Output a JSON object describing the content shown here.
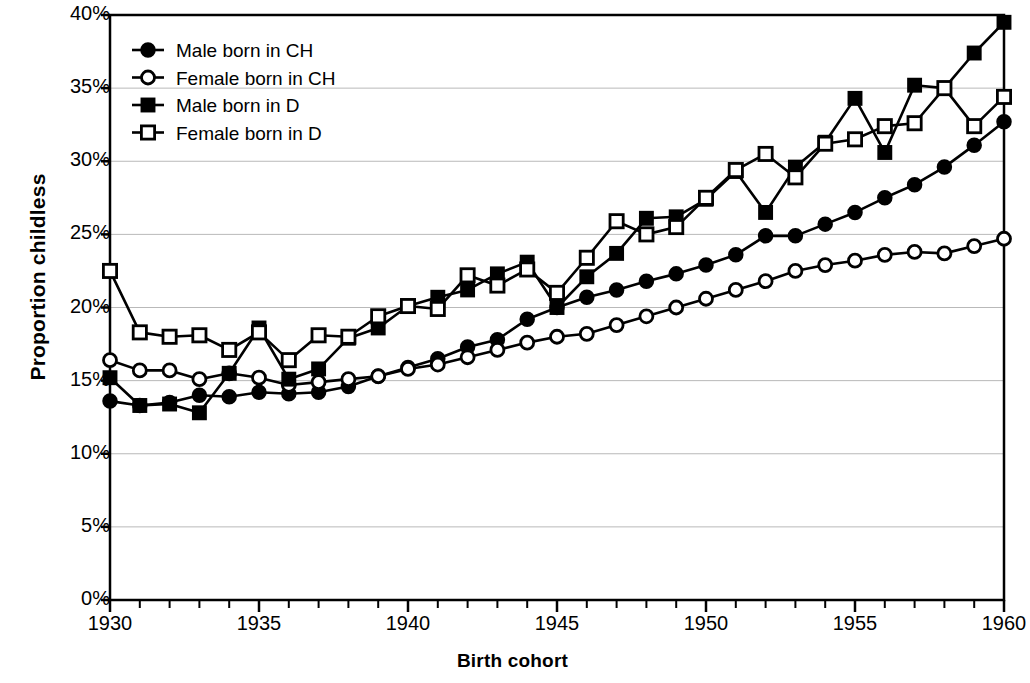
{
  "chart_data": {
    "type": "line",
    "title": "",
    "xlabel": "Birth cohort",
    "ylabel": "Proportion childless",
    "xlim": [
      1930,
      1960
    ],
    "ylim": [
      0,
      40
    ],
    "ytick_labels": [
      "0%",
      "5%",
      "10%",
      "15%",
      "20%",
      "25%",
      "30%",
      "35%",
      "40%"
    ],
    "ytick_values": [
      0,
      5,
      10,
      15,
      20,
      25,
      30,
      35,
      40
    ],
    "xtick_labels": [
      "1930",
      "1935",
      "1940",
      "1945",
      "1950",
      "1955",
      "1960"
    ],
    "xtick_values": [
      1930,
      1935,
      1940,
      1945,
      1950,
      1955,
      1960
    ],
    "x_minor_tick_step": 1,
    "grid": "horizontal",
    "legend_position": "top-left",
    "line_color": "#000000",
    "x": [
      1930,
      1931,
      1932,
      1933,
      1934,
      1935,
      1936,
      1937,
      1938,
      1939,
      1940,
      1941,
      1942,
      1943,
      1944,
      1945,
      1946,
      1947,
      1948,
      1949,
      1950,
      1951,
      1952,
      1953,
      1954,
      1955,
      1956,
      1957,
      1958,
      1959,
      1960
    ],
    "series": [
      {
        "name": "Male born in CH",
        "marker": "filled-circle",
        "values": [
          13.6,
          13.3,
          13.5,
          14.0,
          13.9,
          14.2,
          14.1,
          14.2,
          14.6,
          15.3,
          15.9,
          16.5,
          17.3,
          17.8,
          19.2,
          20.0,
          20.7,
          21.2,
          21.8,
          22.3,
          22.9,
          23.6,
          24.9,
          24.9,
          25.7,
          26.5,
          27.5,
          28.4,
          29.6,
          31.1,
          32.7
        ]
      },
      {
        "name": "Female born in CH",
        "marker": "open-circle",
        "values": [
          16.4,
          15.7,
          15.7,
          15.1,
          15.5,
          15.2,
          14.7,
          14.9,
          15.1,
          15.3,
          15.8,
          16.1,
          16.6,
          17.1,
          17.6,
          18.0,
          18.2,
          18.8,
          19.4,
          20.0,
          20.6,
          21.2,
          21.8,
          22.5,
          22.9,
          23.2,
          23.6,
          23.8,
          23.7,
          24.2,
          24.7
        ]
      },
      {
        "name": "Male born in D",
        "marker": "filled-square",
        "values": [
          15.2,
          13.3,
          13.4,
          12.8,
          15.5,
          18.6,
          15.1,
          15.8,
          17.9,
          18.6,
          20.1,
          20.7,
          21.2,
          22.3,
          23.1,
          20.0,
          22.1,
          23.7,
          26.1,
          26.2,
          27.4,
          29.3,
          26.5,
          29.6,
          31.3,
          34.3,
          30.6,
          35.2,
          35.0,
          37.4,
          39.5
        ]
      },
      {
        "name": "Female born in D",
        "marker": "open-square",
        "values": [
          22.5,
          18.3,
          18.0,
          18.1,
          17.1,
          18.3,
          16.4,
          18.1,
          18.0,
          19.4,
          20.1,
          19.9,
          22.2,
          21.5,
          22.6,
          21.0,
          23.4,
          25.9,
          25.0,
          25.5,
          27.5,
          29.4,
          30.5,
          28.9,
          31.2,
          31.5,
          32.4,
          32.6,
          35.0,
          32.4,
          34.4
        ]
      }
    ]
  },
  "legend": {
    "items": [
      {
        "label": "Male born in CH",
        "marker": "filled-circle"
      },
      {
        "label": "Female born in CH",
        "marker": "open-circle"
      },
      {
        "label": "Male born in D",
        "marker": "filled-square"
      },
      {
        "label": "Female born in D",
        "marker": "open-square"
      }
    ]
  }
}
